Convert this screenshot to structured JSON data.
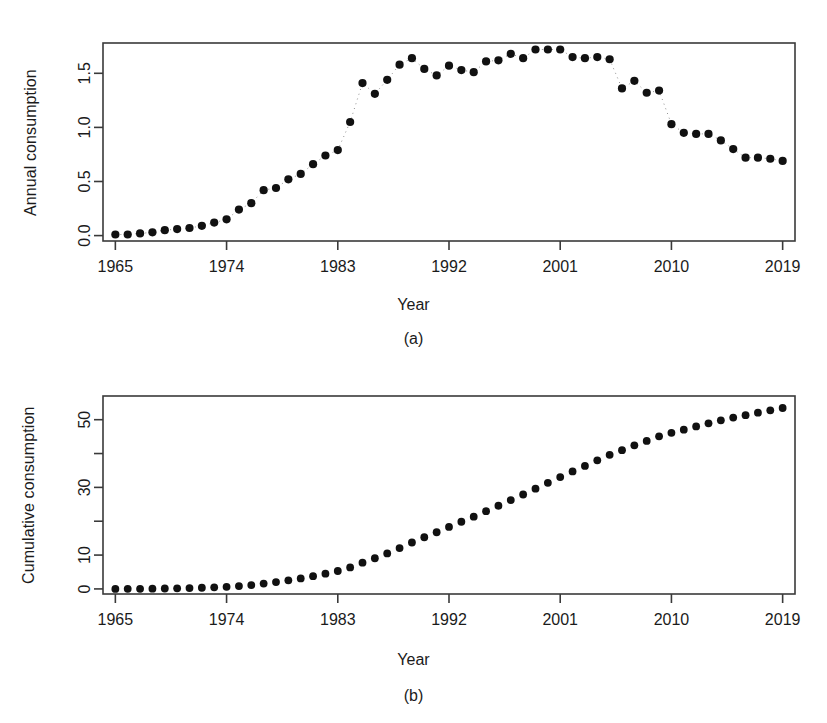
{
  "figure": {
    "panels": [
      {
        "id": "a",
        "caption": "(a)",
        "ylabel": "Annual consumption",
        "xlabel": "Year"
      },
      {
        "id": "b",
        "caption": "(b)",
        "ylabel": "Cumulative consumption",
        "xlabel": "Year"
      }
    ],
    "colors": {
      "point": "#111111",
      "axis": "#3a3a3a",
      "text": "#1b1b1b",
      "background": "#ffffff"
    }
  },
  "chart_data": [
    {
      "type": "scatter",
      "panel": "a",
      "title": "",
      "subtitle": "",
      "xlabel": "Year",
      "ylabel": "Annual consumption",
      "caption": "(a)",
      "grid": false,
      "legend": null,
      "xlim": [
        1964,
        2020
      ],
      "ylim": [
        -0.05,
        1.78
      ],
      "xticks": [
        1965,
        1974,
        1983,
        1992,
        2001,
        2010,
        2019
      ],
      "xticklabels": [
        "1965",
        "1974",
        "1983",
        "1992",
        "2001",
        "2010",
        "2019"
      ],
      "yticks": [
        0.0,
        0.5,
        1.0,
        1.5
      ],
      "yticklabels": [
        "0.0",
        "0.5",
        "1.0",
        "1.5"
      ],
      "x": [
        1965,
        1966,
        1967,
        1968,
        1969,
        1970,
        1971,
        1972,
        1973,
        1974,
        1975,
        1976,
        1977,
        1978,
        1979,
        1980,
        1981,
        1982,
        1983,
        1984,
        1985,
        1986,
        1987,
        1988,
        1989,
        1990,
        1991,
        1992,
        1993,
        1994,
        1995,
        1996,
        1997,
        1998,
        1999,
        2000,
        2001,
        2002,
        2003,
        2004,
        2005,
        2006,
        2007,
        2008,
        2009,
        2010,
        2011,
        2012,
        2013,
        2014,
        2015,
        2016,
        2017,
        2018,
        2019
      ],
      "y": [
        0.01,
        0.01,
        0.02,
        0.03,
        0.05,
        0.06,
        0.07,
        0.09,
        0.12,
        0.15,
        0.24,
        0.3,
        0.42,
        0.44,
        0.52,
        0.57,
        0.66,
        0.74,
        0.79,
        1.05,
        1.41,
        1.31,
        1.44,
        1.58,
        1.64,
        1.54,
        1.48,
        1.57,
        1.53,
        1.51,
        1.61,
        1.62,
        1.68,
        1.64,
        1.72,
        1.72,
        1.72,
        1.65,
        1.64,
        1.65,
        1.63,
        1.36,
        1.43,
        1.32,
        1.34,
        1.03,
        0.95,
        0.94,
        0.94,
        0.88,
        0.8,
        0.72,
        0.72,
        0.71,
        0.69
      ],
      "annotations": [
        {
          "note": "dotted connector segments between some consecutive points, e.g. 1983-1985 and 2006-2010"
        }
      ]
    },
    {
      "type": "scatter",
      "panel": "b",
      "title": "",
      "subtitle": "",
      "xlabel": "Year",
      "ylabel": "Cumulative consumption",
      "caption": "(b)",
      "grid": false,
      "legend": null,
      "xlim": [
        1964,
        2020
      ],
      "ylim": [
        -1.5,
        57
      ],
      "xticks": [
        1965,
        1974,
        1983,
        1992,
        2001,
        2010,
        2019
      ],
      "xticklabels": [
        "1965",
        "1974",
        "1983",
        "1992",
        "2001",
        "2010",
        "2019"
      ],
      "yticks": [
        0,
        10,
        20,
        30,
        40,
        50
      ],
      "yticklabels": [
        "0",
        "10",
        "",
        "30",
        "",
        "50"
      ],
      "x": [
        1965,
        1966,
        1967,
        1968,
        1969,
        1970,
        1971,
        1972,
        1973,
        1974,
        1975,
        1976,
        1977,
        1978,
        1979,
        1980,
        1981,
        1982,
        1983,
        1984,
        1985,
        1986,
        1987,
        1988,
        1989,
        1990,
        1991,
        1992,
        1993,
        1994,
        1995,
        1996,
        1997,
        1998,
        1999,
        2000,
        2001,
        2002,
        2003,
        2004,
        2005,
        2006,
        2007,
        2008,
        2009,
        2010,
        2011,
        2012,
        2013,
        2014,
        2015,
        2016,
        2017,
        2018,
        2019
      ],
      "y": [
        0.01,
        0.02,
        0.04,
        0.07,
        0.12,
        0.18,
        0.25,
        0.34,
        0.46,
        0.61,
        0.85,
        1.15,
        1.57,
        2.01,
        2.53,
        3.1,
        3.76,
        4.5,
        5.29,
        6.34,
        7.75,
        9.06,
        10.5,
        12.08,
        13.72,
        15.26,
        16.74,
        18.31,
        19.84,
        21.35,
        22.96,
        24.58,
        26.26,
        27.9,
        29.62,
        31.34,
        33.06,
        34.71,
        36.35,
        38.0,
        39.63,
        40.99,
        42.42,
        43.74,
        45.08,
        46.11,
        47.06,
        48.0,
        48.94,
        49.82,
        50.62,
        51.34,
        52.06,
        52.77,
        53.46
      ]
    }
  ]
}
